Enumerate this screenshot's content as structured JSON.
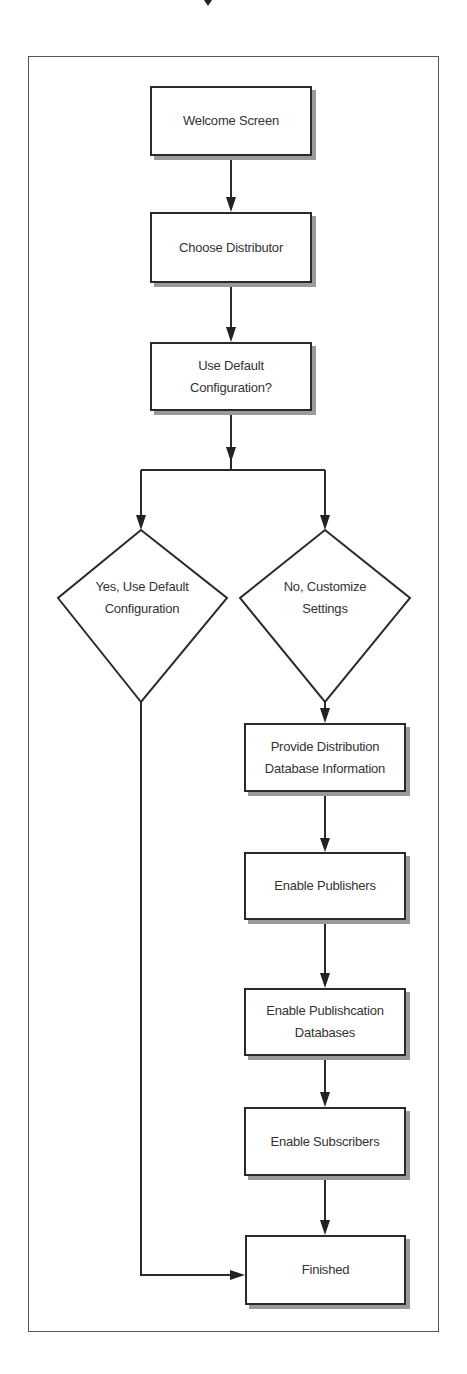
{
  "diagram": {
    "type": "flowchart",
    "title": "",
    "nodes": [
      {
        "id": "welcome",
        "shape": "rect",
        "label": "Welcome Screen"
      },
      {
        "id": "choose",
        "shape": "rect",
        "label": "Choose Distributor"
      },
      {
        "id": "use_default",
        "shape": "rect",
        "label": "Use Default\nConfiguration?"
      },
      {
        "id": "yes_default",
        "shape": "diamond",
        "label": "Yes, Use Default\nConfiguration"
      },
      {
        "id": "no_customize",
        "shape": "diamond",
        "label": "No, Customize\nSettings"
      },
      {
        "id": "provide_db",
        "shape": "rect",
        "label": "Provide Distribution\nDatabase Information"
      },
      {
        "id": "enable_publishers",
        "shape": "rect",
        "label": "Enable Publishers"
      },
      {
        "id": "enable_pub_db",
        "shape": "rect",
        "label": "Enable Publishcation\nDatabases"
      },
      {
        "id": "enable_subscribers",
        "shape": "rect",
        "label": "Enable Subscribers"
      },
      {
        "id": "finished",
        "shape": "rect",
        "label": "Finished"
      }
    ],
    "edges": [
      {
        "from": "welcome",
        "to": "choose"
      },
      {
        "from": "choose",
        "to": "use_default"
      },
      {
        "from": "use_default",
        "to": "yes_default"
      },
      {
        "from": "use_default",
        "to": "no_customize"
      },
      {
        "from": "no_customize",
        "to": "provide_db"
      },
      {
        "from": "provide_db",
        "to": "enable_publishers"
      },
      {
        "from": "enable_publishers",
        "to": "enable_pub_db"
      },
      {
        "from": "enable_pub_db",
        "to": "enable_subscribers"
      },
      {
        "from": "enable_subscribers",
        "to": "finished"
      },
      {
        "from": "yes_default",
        "to": "finished"
      }
    ],
    "colors": {
      "stroke": "#2a2a2a",
      "shadow": "#9a9a9a",
      "text": "#333333",
      "frame": "#555555"
    }
  }
}
